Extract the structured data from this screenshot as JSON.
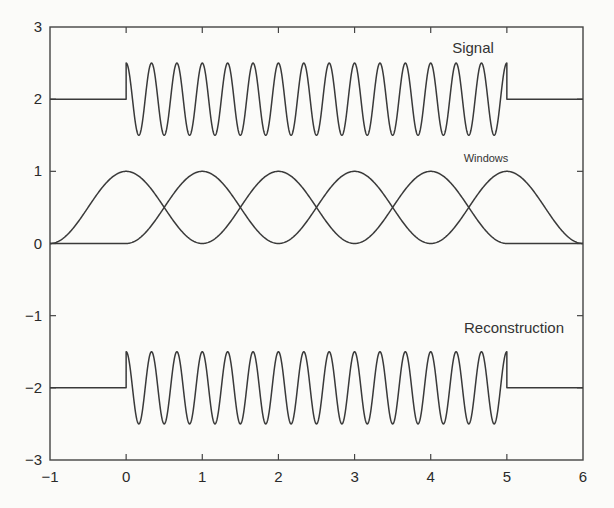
{
  "chart_data": {
    "type": "line",
    "title": "",
    "xlabel": "",
    "ylabel": "",
    "xlim": [
      -1,
      6
    ],
    "ylim": [
      -3,
      3
    ],
    "grid": false,
    "legend": "none",
    "x_ticks": [
      -1,
      0,
      1,
      2,
      3,
      4,
      5,
      6
    ],
    "x_tick_labels": [
      "−1",
      "0",
      "1",
      "2",
      "3",
      "4",
      "5",
      "6"
    ],
    "y_ticks": [
      -3,
      -2,
      -1,
      0,
      1,
      2,
      3
    ],
    "y_tick_labels": [
      "−3",
      "−2",
      "−1",
      "0",
      "1",
      "2",
      "3"
    ],
    "series": [
      {
        "name": "Signal",
        "description": "offset 2 for t<0 and t>5; 2 + 0.5*cos(2*pi*3*t) for 0<=t<=5",
        "offset": 2,
        "amplitude": 0.5,
        "frequency": 3,
        "t_start": 0,
        "t_end": 5
      },
      {
        "name": "Window A",
        "description": "raised-cosine windows peaking at t = 0, 2, 4 (value 1), zero at odd t; zero from 5 to 6",
        "offset": 0,
        "peaks": [
          0,
          2,
          4
        ],
        "range": [
          -1,
          5
        ]
      },
      {
        "name": "Window B",
        "description": "raised-cosine windows peaking at t = 1, 3, 5 (value 1), zero at even t; zero from -1 to 0",
        "offset": 0,
        "peaks": [
          1,
          3,
          5
        ],
        "range": [
          0,
          6
        ]
      },
      {
        "name": "Reconstruction",
        "description": "offset -2 for t<0 and t>5; -2 + 0.5*cos(2*pi*3*t) for 0<=t<=5",
        "offset": -2,
        "amplitude": 0.5,
        "frequency": 3,
        "t_start": 0,
        "t_end": 5
      }
    ],
    "annotations": [
      {
        "text": "Signal",
        "x": 4.4,
        "y": 2.7
      },
      {
        "text": "Windows",
        "x": 4.7,
        "y": 1.2
      },
      {
        "text": "Reconstruction",
        "x": 5.0,
        "y": -1.2
      }
    ]
  },
  "labels": {
    "signal": "Signal",
    "windows": "Windows",
    "reconstruction": "Reconstruction"
  },
  "colors": {
    "line": "#3a3a3a",
    "frame": "#444444",
    "background": "#fbfbf9"
  }
}
